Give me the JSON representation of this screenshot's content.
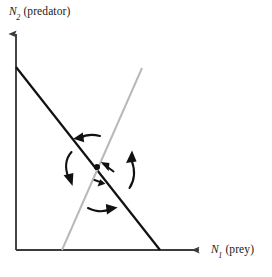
{
  "figure": {
    "title": "",
    "type": "phase-plane-diagram",
    "background_color": "#ffffff"
  },
  "axes": {
    "y": {
      "variable": "N",
      "subscript": "2",
      "description": "(predator)",
      "full_label": "N2 (predator)",
      "color": "#3c3c3c",
      "arrow": "up"
    },
    "x": {
      "variable": "N",
      "subscript": "1",
      "description": "(prey)",
      "full_label": "N1 (prey)",
      "color": "#3c3c3c",
      "arrow": "right"
    },
    "origin": {
      "x": 16,
      "y": 250
    }
  },
  "chart_data": {
    "type": "line",
    "title": "",
    "xlabel": "N1 (prey)",
    "ylabel": "N2 (predator)",
    "grid": false,
    "legend": "none",
    "xlim": [
      0,
      207
    ],
    "ylim": [
      0,
      277
    ],
    "series": [
      {
        "name": "prey-isocline",
        "color": "#111111",
        "width": 2.2,
        "points": [
          [
            16,
            67
          ],
          [
            160,
            250
          ]
        ],
        "slope": "negative",
        "description": "Prey zero-growth isocline, downward sloping from N2 axis to N1 axis"
      },
      {
        "name": "predator-isocline",
        "color": "#b9b9b9",
        "width": 2.0,
        "points": [
          [
            62,
            250
          ],
          [
            142,
            68
          ]
        ],
        "slope": "positive",
        "description": "Predator zero-growth isocline, upward sloping"
      }
    ],
    "annotations": [
      {
        "name": "equilibrium-point",
        "kind": "point",
        "x": 97,
        "y": 167,
        "color": "#111111",
        "radius": 3.0
      },
      {
        "name": "trajectory-arrow-upper-left",
        "kind": "arrow",
        "direction": "left",
        "label": ""
      },
      {
        "name": "trajectory-arrow-left",
        "kind": "curved-arrow",
        "direction": "down-left",
        "label": ""
      },
      {
        "name": "trajectory-arrow-right",
        "kind": "curved-arrow",
        "direction": "up-right",
        "label": ""
      },
      {
        "name": "trajectory-arrow-lower",
        "kind": "arrow",
        "direction": "right",
        "label": ""
      },
      {
        "name": "convergence-arrow-upper",
        "kind": "arrow",
        "direction": "up-left",
        "label": ""
      },
      {
        "name": "convergence-arrow-lower",
        "kind": "arrow",
        "direction": "down-right",
        "label": ""
      }
    ]
  }
}
